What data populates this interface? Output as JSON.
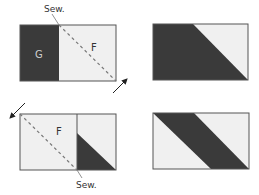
{
  "colors": {
    "dark": "#3a3a3a",
    "light": "#f0f0f0",
    "outline": "#555555",
    "dash": "#777777",
    "arrow": "#222222",
    "label_on_dark": "#cfcfcf",
    "label_on_light": "#333333"
  },
  "panels": {
    "top_left": {
      "sew_label": "Sew.",
      "dark_label": "G",
      "light_label": "F"
    },
    "top_right": {},
    "bottom_left": {
      "sew_label": "Sew.",
      "light_label": "F"
    },
    "bottom_right": {}
  }
}
